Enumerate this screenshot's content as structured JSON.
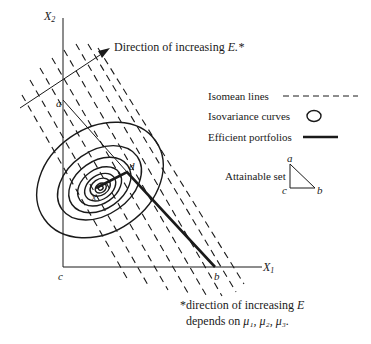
{
  "axes": {
    "x_label": "X",
    "x_sub": "1",
    "y_label": "X",
    "y_sub": "2",
    "origin_label": "c"
  },
  "points": {
    "a": "a",
    "b": "b",
    "c": "c",
    "d": "d",
    "center": "x"
  },
  "arrow": {
    "label": "Direction of increasing ",
    "label_var": "E.*"
  },
  "legend": {
    "isomean": "Isomean lines",
    "isovariance": "Isovariance curves",
    "efficient": "Efficient portfolios",
    "attainable": "Attainable set",
    "tri_a": "a",
    "tri_b": "b",
    "tri_c": "c"
  },
  "footnote": {
    "line1_prefix": "*direction of increasing ",
    "line1_var": "E",
    "line2_prefix": "depends on ",
    "line2_vars": "μ₁, μ₂, μ₃."
  },
  "colors": {
    "ink": "#1a1a1a",
    "background": "#ffffff"
  }
}
